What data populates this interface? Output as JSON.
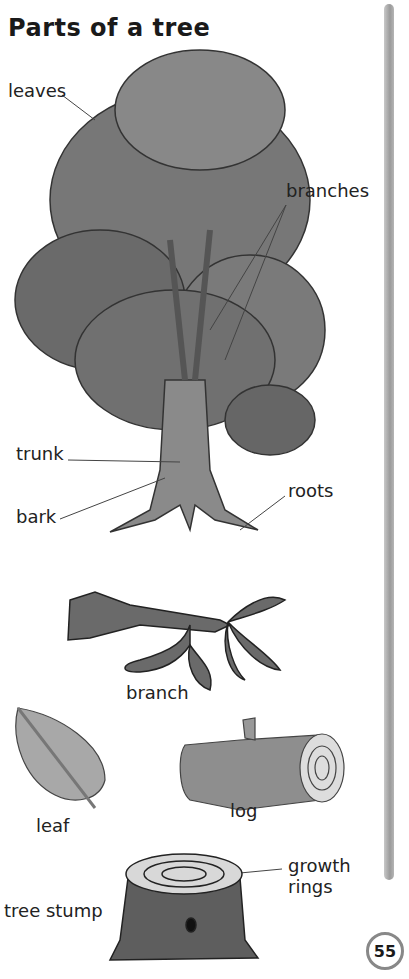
{
  "page": {
    "title": "Parts of a tree",
    "page_number": "55"
  },
  "tree_labels": {
    "leaves": "leaves",
    "branches": "branches",
    "trunk": "trunk",
    "bark": "bark",
    "roots": "roots"
  },
  "items": [
    {
      "label": "branch"
    },
    {
      "label": "leaf"
    },
    {
      "label": "log"
    },
    {
      "label": "tree stump"
    }
  ],
  "stump_callout": {
    "line1": "growth",
    "line2": "rings"
  }
}
